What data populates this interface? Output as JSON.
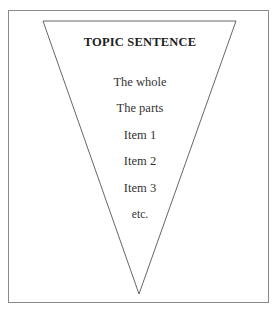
{
  "diagram": {
    "type": "inverted-triangle-funnel",
    "title": "TOPIC SENTENCE",
    "levels": [
      {
        "label": "The whole"
      },
      {
        "label": "The parts"
      },
      {
        "label": "Item 1"
      },
      {
        "label": "Item 2"
      },
      {
        "label": "Item 3"
      },
      {
        "label": "etc."
      }
    ],
    "colors": {
      "stroke": "#555555",
      "frame": "#8a8a8a",
      "text": "#333333",
      "background": "#ffffff"
    }
  }
}
